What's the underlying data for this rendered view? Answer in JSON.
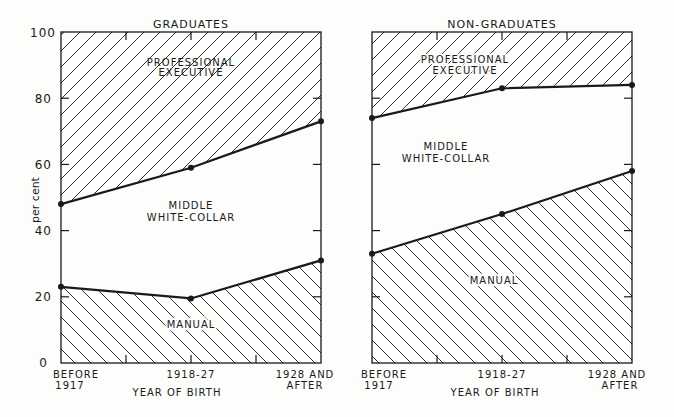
{
  "chart_data": [
    {
      "type": "area",
      "stacked": true,
      "title": "GRADUATES",
      "xlabel": "YEAR OF BIRTH",
      "ylabel": "per cent",
      "ylim": [
        0,
        100
      ],
      "yticks": [
        0,
        20,
        40,
        60,
        80,
        100
      ],
      "categories": [
        "BEFORE 1917",
        "1918-27",
        "1928 AND AFTER"
      ],
      "boundaries": {
        "manual_upper": [
          23,
          19.5,
          31
        ],
        "middle_upper": [
          48,
          59,
          73
        ]
      },
      "series": [
        {
          "name": "MANUAL",
          "values": [
            23,
            19.5,
            31
          ],
          "pattern": "hatch-backslash"
        },
        {
          "name": "MIDDLE WHITE-COLLAR",
          "values": [
            25,
            39.5,
            42
          ],
          "pattern": "none"
        },
        {
          "name": "PROFESSIONAL EXECUTIVE",
          "values": [
            52,
            41,
            27
          ],
          "pattern": "hatch-slash"
        }
      ],
      "grid": false
    },
    {
      "type": "area",
      "stacked": true,
      "title": "NON-GRADUATES",
      "xlabel": "YEAR OF BIRTH",
      "ylabel": "",
      "ylim": [
        0,
        100
      ],
      "yticks": [
        0,
        20,
        40,
        60,
        80,
        100
      ],
      "categories": [
        "BEFORE 1917",
        "1918-27",
        "1928 AND AFTER"
      ],
      "boundaries": {
        "manual_upper": [
          33,
          45,
          58
        ],
        "middle_upper": [
          74,
          83,
          84
        ]
      },
      "series": [
        {
          "name": "MANUAL",
          "values": [
            33,
            45,
            58
          ],
          "pattern": "hatch-backslash"
        },
        {
          "name": "MIDDLE WHITE-COLLAR",
          "values": [
            41,
            38,
            26
          ],
          "pattern": "none"
        },
        {
          "name": "PROFESSIONAL EXECUTIVE",
          "values": [
            26,
            17,
            16
          ],
          "pattern": "hatch-slash"
        }
      ],
      "grid": false
    }
  ],
  "labels": {
    "left_title": "GRADUATES",
    "right_title": "NON-GRADUATES",
    "ylabel": "per cent",
    "xlabel": "YEAR OF BIRTH",
    "prof_line1": "PROFESSIONAL",
    "prof_line2": "EXECUTIVE",
    "middle_line1": "MIDDLE",
    "middle_line2": "WHITE-COLLAR",
    "manual": "MANUAL",
    "x0_line1": "BEFORE",
    "x0_line2": "1917",
    "x1": "1918-27",
    "x2_line1": "1928 AND",
    "x2_line2": "AFTER",
    "yticks": [
      "0",
      "20",
      "40",
      "60",
      "80",
      "100"
    ]
  }
}
